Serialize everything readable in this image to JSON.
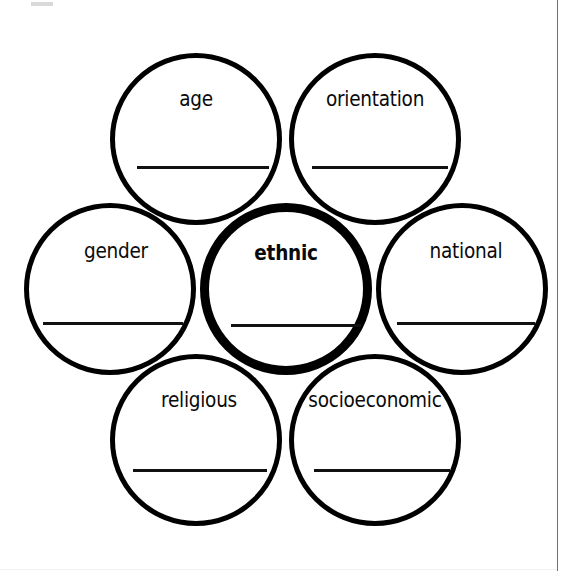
{
  "page": {
    "background_color": "#ffffff",
    "stroke_color": "#000000",
    "width": 571,
    "height": 571
  },
  "diagram": {
    "type": "cluster-of-circles",
    "center_circle": "ethnic",
    "circles": [
      {
        "id": "age",
        "label": "age",
        "emphasis": false,
        "position": "top-left",
        "center_x": 196,
        "center_y": 139,
        "diameter": 172,
        "has_write_in_line": true
      },
      {
        "id": "orientation",
        "label": "orientation",
        "emphasis": false,
        "position": "top-right",
        "center_x": 375,
        "center_y": 139,
        "diameter": 172,
        "has_write_in_line": true
      },
      {
        "id": "gender",
        "label": "gender",
        "emphasis": false,
        "position": "middle-left",
        "center_x": 110,
        "center_y": 289,
        "diameter": 172,
        "has_write_in_line": true
      },
      {
        "id": "ethnic",
        "label": "ethnic",
        "emphasis": true,
        "position": "center",
        "center_x": 286,
        "center_y": 289,
        "diameter": 172,
        "has_write_in_line": true
      },
      {
        "id": "national",
        "label": "national",
        "emphasis": false,
        "position": "middle-right",
        "center_x": 462,
        "center_y": 289,
        "diameter": 172,
        "has_write_in_line": true
      },
      {
        "id": "religious",
        "label": "religious",
        "emphasis": false,
        "position": "bottom-left",
        "center_x": 196,
        "center_y": 440,
        "diameter": 172,
        "has_write_in_line": true
      },
      {
        "id": "socioeconomic",
        "label": "socioeconomic",
        "emphasis": false,
        "position": "bottom-right",
        "center_x": 375,
        "center_y": 440,
        "diameter": 172,
        "has_write_in_line": true
      }
    ]
  }
}
